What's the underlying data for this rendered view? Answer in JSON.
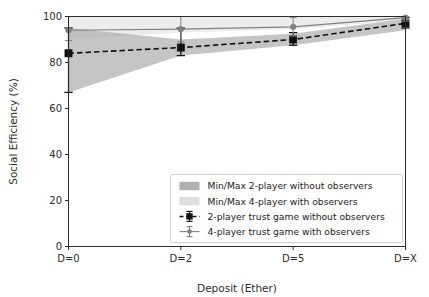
{
  "chart_data": {
    "type": "line",
    "title": "",
    "xlabel": "Deposit (Ether)",
    "ylabel": "Social Efficiency (%)",
    "categories": [
      "D=0",
      "D=2",
      "D=5",
      "D=X"
    ],
    "xtick_labels": [
      "D=0",
      "D=2",
      "D=5",
      "D=X"
    ],
    "ytick_labels": [
      "0",
      "20",
      "40",
      "60",
      "80",
      "100"
    ],
    "ytick_values": [
      0,
      20,
      40,
      60,
      80,
      100
    ],
    "ylim": [
      0,
      100
    ],
    "grid": false,
    "legend_position": "lower center",
    "series": [
      {
        "name": "2-player trust game without observers",
        "type": "line-errorbar",
        "linestyle": "dashed",
        "color": "#111111",
        "marker": "square",
        "values": [
          84.0,
          86.5,
          90.0,
          97.0
        ],
        "err_low": [
          67.0,
          83.0,
          87.5,
          95.0
        ],
        "err_high": [
          95.0,
          95.0,
          93.0,
          99.5
        ]
      },
      {
        "name": "4-player trust game with observers",
        "type": "line-errorbar",
        "linestyle": "solid",
        "color": "#808080",
        "marker": "circle",
        "values": [
          94.0,
          94.5,
          95.5,
          99.5
        ],
        "err_low": [
          89.5,
          89.0,
          91.5,
          98.0
        ],
        "err_high": [
          100.0,
          100.0,
          99.5,
          100.0
        ]
      }
    ],
    "bands": [
      {
        "name": "Min/Max 2-player without observers",
        "color": "#a9a9a9",
        "lower": [
          67.0,
          83.0,
          87.5,
          94.0
        ],
        "upper": [
          95.0,
          90.0,
          92.5,
          99.0
        ]
      },
      {
        "name": "Min/Max 4-player with observers",
        "color": "#dcdcdc",
        "lower": [
          90.0,
          93.0,
          94.5,
          98.5
        ],
        "upper": [
          100.0,
          100.0,
          100.0,
          100.0
        ]
      }
    ],
    "legend_entries": [
      {
        "label": "Min/Max 2-player without observers",
        "kind": "patch",
        "color": "#b0b0b0"
      },
      {
        "label": "Min/Max 4-player with observers",
        "kind": "patch",
        "color": "#dedede"
      },
      {
        "label": "2-player trust game without observers",
        "kind": "line-marker",
        "color": "#111111",
        "linestyle": "dashed"
      },
      {
        "label": "4-player trust game with observers",
        "kind": "line-marker",
        "color": "#808080",
        "linestyle": "solid"
      }
    ],
    "colors": {
      "axis": "#2b2b2b",
      "band_2player": "#a9a9a9",
      "band_4player": "#dcdcdc",
      "line_2player": "#111111",
      "line_4player": "#808080",
      "background": "#ffffff",
      "legend_border": "#cccccc"
    }
  }
}
